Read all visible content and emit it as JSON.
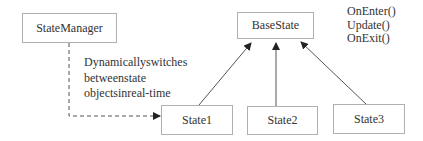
{
  "diagram": {
    "type": "class-diagram",
    "nodes": {
      "state_manager": "StateManager",
      "base_state": "BaseState",
      "state1": "State1",
      "state2": "State2",
      "state3": "State3"
    },
    "base_state_methods": [
      "OnEnter()",
      "Update()",
      "OnExit()"
    ],
    "annotation": [
      "Dynamicallyswitches",
      "betweenstate",
      "objectsinreal-time"
    ],
    "edges": [
      {
        "from": "StateManager",
        "to": "State1",
        "style": "dashed",
        "kind": "association"
      },
      {
        "from": "State1",
        "to": "BaseState",
        "style": "solid",
        "kind": "inheritance"
      },
      {
        "from": "State2",
        "to": "BaseState",
        "style": "solid",
        "kind": "inheritance"
      },
      {
        "from": "State3",
        "to": "BaseState",
        "style": "solid",
        "kind": "inheritance"
      }
    ],
    "colors": {
      "box_border": "#b0b0b0",
      "line": "#555555",
      "text": "#333333"
    }
  }
}
